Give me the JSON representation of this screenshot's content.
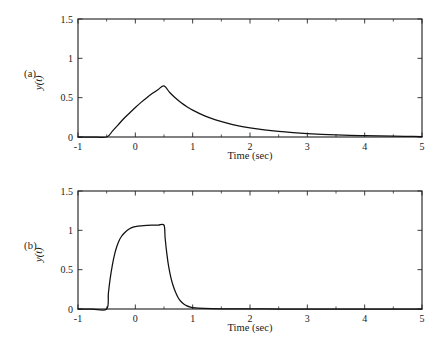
{
  "figure": {
    "background": "#ffffff",
    "line_color": "#111111",
    "axis_color": "#262626",
    "width": 447,
    "height": 344
  },
  "panels": [
    {
      "id": "a",
      "label": "(a)",
      "xlabel": "Time (sec)",
      "ylabel": "y(t)",
      "x_ticks": [
        "-1",
        "0",
        "1",
        "2",
        "3",
        "4",
        "5"
      ],
      "y_ticks": [
        "0",
        "0.5",
        "1",
        "1.5"
      ]
    },
    {
      "id": "b",
      "label": "(b)",
      "xlabel": "Time (sec)",
      "ylabel": "y(t)",
      "x_ticks": [
        "-1",
        "0",
        "1",
        "2",
        "3",
        "4",
        "5"
      ],
      "y_ticks": [
        "0",
        "0.5",
        "1",
        "1.5"
      ]
    }
  ],
  "chart_data": [
    {
      "type": "line",
      "title": "",
      "panel": "(a)",
      "xlabel": "Time (sec)",
      "ylabel": "y(t)",
      "xlim": [
        -1,
        5
      ],
      "ylim": [
        0,
        1.5
      ],
      "xticks": [
        -1,
        0,
        1,
        2,
        3,
        4,
        5
      ],
      "yticks": [
        0,
        0.5,
        1,
        1.5
      ],
      "xtick_labels": [
        "-1",
        "0",
        "1",
        "2",
        "3",
        "4",
        "5"
      ],
      "ytick_labels": [
        "0",
        "0.5",
        "1",
        "1.5"
      ],
      "minor_xticks": [
        -0.5,
        0.5,
        1.5,
        2.5,
        3.5,
        4.5
      ],
      "grid": false,
      "legend": null,
      "series": [
        {
          "name": "y(t)",
          "color": "#111111",
          "x": [
            -1.0,
            -0.75,
            -0.5,
            -0.4,
            -0.3,
            -0.2,
            -0.1,
            0.0,
            0.1,
            0.2,
            0.3,
            0.4,
            0.5,
            0.6,
            0.7,
            0.8,
            0.9,
            1.0,
            1.2,
            1.4,
            1.6,
            1.8,
            2.0,
            2.25,
            2.5,
            2.75,
            3.0,
            3.25,
            3.5,
            3.75,
            4.0,
            4.25,
            4.5,
            4.75,
            5.0
          ],
          "y": [
            0.0,
            0.0,
            0.0,
            0.075,
            0.155,
            0.235,
            0.305,
            0.375,
            0.44,
            0.5,
            0.555,
            0.605,
            0.65,
            0.565,
            0.495,
            0.435,
            0.385,
            0.342,
            0.272,
            0.218,
            0.176,
            0.142,
            0.116,
            0.09,
            0.07,
            0.055,
            0.043,
            0.034,
            0.027,
            0.021,
            0.017,
            0.013,
            0.01,
            0.008,
            0.006
          ]
        }
      ],
      "annotations": {
        "onset_time": -0.5,
        "peak_time": 0.5,
        "peak_value": 0.65,
        "description": "Ramp-up from t=-0.5 to a peak of about 0.65 at t=0.5, then exponential decay toward zero by t=5"
      }
    },
    {
      "type": "line",
      "title": "",
      "panel": "(b)",
      "xlabel": "Time (sec)",
      "ylabel": "y(t)",
      "xlim": [
        -1,
        5
      ],
      "ylim": [
        0,
        1.5
      ],
      "xticks": [
        -1,
        0,
        1,
        2,
        3,
        4,
        5
      ],
      "yticks": [
        0,
        0.5,
        1,
        1.5
      ],
      "xtick_labels": [
        "-1",
        "0",
        "1",
        "2",
        "3",
        "4",
        "5"
      ],
      "ytick_labels": [
        "0",
        "0.5",
        "1",
        "1.5"
      ],
      "minor_xticks": [
        -0.5,
        0.5,
        1.5,
        2.5,
        3.5,
        4.5
      ],
      "grid": false,
      "legend": null,
      "series": [
        {
          "name": "y(t)",
          "color": "#111111",
          "x": [
            -1.0,
            -0.75,
            -0.5,
            -0.47,
            -0.44,
            -0.4,
            -0.36,
            -0.32,
            -0.28,
            -0.24,
            -0.2,
            -0.15,
            -0.1,
            -0.05,
            0.0,
            0.1,
            0.2,
            0.3,
            0.4,
            0.5,
            0.52,
            0.55,
            0.58,
            0.62,
            0.66,
            0.7,
            0.75,
            0.8,
            0.85,
            0.9,
            0.95,
            1.0,
            1.2,
            1.5,
            2.0,
            2.5,
            3.0,
            3.5,
            4.0,
            4.5,
            5.0
          ],
          "y": [
            0.0,
            0.0,
            0.0,
            0.2,
            0.38,
            0.56,
            0.7,
            0.8,
            0.875,
            0.925,
            0.96,
            0.995,
            1.02,
            1.038,
            1.048,
            1.058,
            1.063,
            1.065,
            1.066,
            1.066,
            0.9,
            0.7,
            0.545,
            0.4,
            0.295,
            0.215,
            0.14,
            0.092,
            0.06,
            0.04,
            0.026,
            0.018,
            0.008,
            0.003,
            0.001,
            0.0,
            0.0,
            0.0,
            0.0,
            0.0,
            0.0
          ]
        }
      ],
      "annotations": {
        "onset_time": -0.5,
        "plateau_value": 1.07,
        "plateau_start": -0.1,
        "plateau_end": 0.5,
        "decay_end": 1.0,
        "description": "Fast exponential rise at t=-0.5 to a flat plateau near 1.07, held until t=0.5, then fast exponential decay to zero by t=1"
      }
    }
  ]
}
